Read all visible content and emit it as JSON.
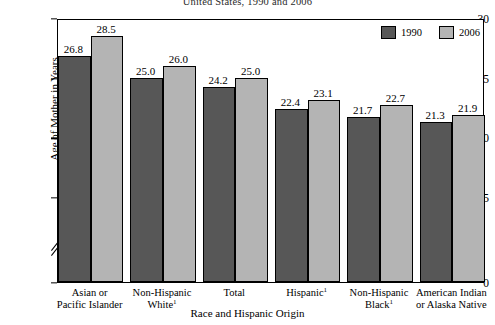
{
  "chart_data": {
    "type": "bar",
    "title": "United States, 1990 and 2006",
    "xlabel": "Race and Hispanic Origin",
    "ylabel": "Age of Mother in Years",
    "ylim": [
      0,
      30
    ],
    "yticks": [
      0,
      15,
      20,
      25,
      30
    ],
    "ytick_labels": [
      "0",
      "15",
      "20",
      "25",
      "30"
    ],
    "axis_break": true,
    "axis_break_between": [
      0,
      15
    ],
    "grid": false,
    "legend_position": "top-right",
    "categories": [
      "Asian or Pacific Islander",
      "Non-Hispanic White¹",
      "Total",
      "Hispanic¹",
      "Non-Hispanic Black¹",
      "American Indian or Alaska Native"
    ],
    "category_lines": [
      [
        "Asian or",
        "Pacific Islander"
      ],
      [
        "Non-Hispanic",
        "White¹"
      ],
      [
        "Total",
        ""
      ],
      [
        "Hispanic¹",
        ""
      ],
      [
        "Non-Hispanic",
        "Black¹"
      ],
      [
        "American Indian",
        "or Alaska Native"
      ]
    ],
    "series": [
      {
        "name": "1990",
        "color": "#575757",
        "values": [
          26.8,
          25.0,
          24.2,
          22.4,
          21.7,
          21.3
        ],
        "value_labels": [
          "26.8",
          "25.0",
          "24.2",
          "22.4",
          "21.7",
          "21.3"
        ]
      },
      {
        "name": "2006",
        "color": "#b4b4b4",
        "values": [
          28.5,
          26.0,
          25.0,
          23.1,
          22.7,
          21.9
        ],
        "value_labels": [
          "28.5",
          "26.0",
          "25.0",
          "23.1",
          "22.7",
          "21.9"
        ]
      }
    ]
  },
  "legend": {
    "items": [
      {
        "label": "1990"
      },
      {
        "label": "2006"
      }
    ]
  }
}
